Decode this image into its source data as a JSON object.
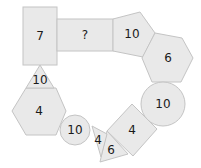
{
  "diagram": {
    "colors": {
      "fill": "#e9e9e9",
      "stroke": "#c4c4c4",
      "text": "#1a1a1a"
    },
    "shapes": [
      {
        "id": "rect-tall",
        "type": "rectangle",
        "label": "7"
      },
      {
        "id": "rect-wide",
        "type": "rectangle",
        "label": "?"
      },
      {
        "id": "pentagon",
        "type": "pentagon",
        "label": "10"
      },
      {
        "id": "hexagon-right",
        "type": "hexagon",
        "label": "6"
      },
      {
        "id": "circle-large",
        "type": "circle",
        "label": "10"
      },
      {
        "id": "square-rotated",
        "type": "square",
        "label": "4"
      },
      {
        "id": "triangle-6",
        "type": "triangle",
        "label": "6"
      },
      {
        "id": "triangle-4",
        "type": "triangle",
        "label": "4"
      },
      {
        "id": "circle-small",
        "type": "circle",
        "label": "10"
      },
      {
        "id": "hexagon-left",
        "type": "hexagon",
        "label": "4"
      },
      {
        "id": "triangle-top",
        "type": "triangle",
        "label": "10"
      }
    ]
  }
}
